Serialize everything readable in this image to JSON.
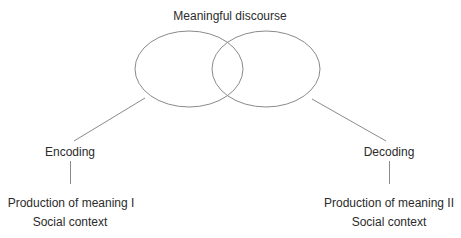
{
  "title": "Meaningful discourse",
  "left_branch": {
    "process": "Encoding",
    "production": "Production of meaning I",
    "context": "Social context"
  },
  "right_branch": {
    "process": "Decoding",
    "production": "Production of meaning II",
    "context": "Social context"
  },
  "colors": {
    "stroke": "#8a8a8a",
    "text": "#2b2b2b",
    "background": "#ffffff"
  }
}
